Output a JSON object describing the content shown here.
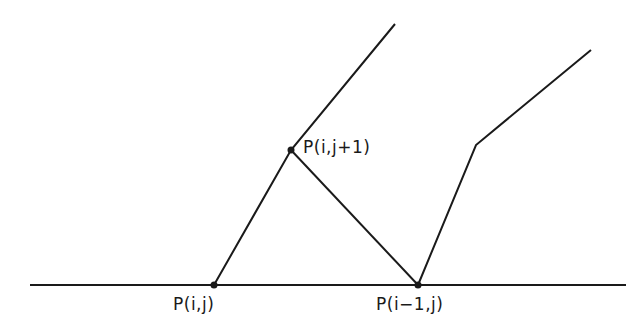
{
  "diagram": {
    "stroke_color": "#1a1a1a",
    "background": "#ffffff",
    "baseline": {
      "x1": 30,
      "y1": 285,
      "x2": 626,
      "y2": 285
    },
    "points": [
      {
        "id": "p_ij",
        "label": "P(i,j)",
        "x": 214,
        "y": 285,
        "label_x": 173,
        "label_y": 294
      },
      {
        "id": "p_im1j",
        "label": "P(i−1,j)",
        "x": 418,
        "y": 285,
        "label_x": 376,
        "label_y": 294
      },
      {
        "id": "p_ijp1",
        "label": "P(i,j+1)",
        "x": 291,
        "y": 150,
        "label_x": 303,
        "label_y": 137
      }
    ],
    "segments": [
      {
        "name": "left-ray",
        "points": "214,285 291,150 395,24"
      },
      {
        "name": "diagonal-connector",
        "points": "291,150 418,285"
      },
      {
        "name": "right-polyline",
        "points": "418,285 476,145 591,50"
      }
    ]
  }
}
